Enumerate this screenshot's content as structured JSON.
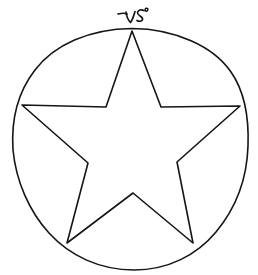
{
  "image": {
    "kind": "hand-drawn-ink-sketch",
    "subject": "five-pointed star (pentagram outline) inscribed in a circle",
    "width": 258,
    "height": 275,
    "background_color": "#ffffff",
    "ink_color": "#151515",
    "stroke_width": 1.6,
    "alt_text": "Hand drawn five pointed star inside a circle with a small handwritten mark above the top point"
  },
  "annotation": {
    "label": "handwritten mark",
    "transcription": "VS",
    "description": "small cursive squiggle resembling the letters V and S, drawn just above the star's upper point",
    "position": {
      "x": 118,
      "y": 8,
      "width": 34,
      "height": 20
    }
  },
  "shapes": {
    "circle": {
      "name": "enclosing-circle",
      "center_x": 130,
      "center_y": 149,
      "radius_x": 118,
      "radius_y": 121
    },
    "star": {
      "name": "five-pointed-star",
      "outer_points": [
        {
          "label": "top",
          "x": 132,
          "y": 31
        },
        {
          "label": "right",
          "x": 240,
          "y": 106
        },
        {
          "label": "bottom-right",
          "x": 193,
          "y": 243
        },
        {
          "label": "bottom-left",
          "x": 67,
          "y": 243
        },
        {
          "label": "left",
          "x": 22,
          "y": 105
        }
      ],
      "inner_points": [
        {
          "label": "upper-right",
          "x": 161,
          "y": 107
        },
        {
          "label": "lower-right",
          "x": 177,
          "y": 162
        },
        {
          "label": "bottom",
          "x": 133,
          "y": 193
        },
        {
          "label": "lower-left",
          "x": 88,
          "y": 163
        },
        {
          "label": "upper-left",
          "x": 106,
          "y": 107
        }
      ]
    }
  }
}
